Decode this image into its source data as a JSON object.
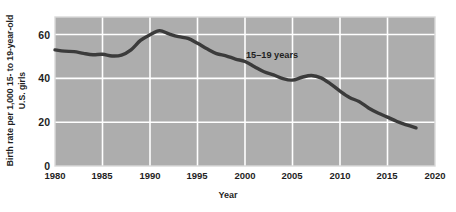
{
  "chart_data": {
    "type": "line",
    "title": "",
    "xlabel": "Year",
    "ylabel_lines": [
      "Birth rate per 1,000 15- to 19-year-old",
      "U.S. girls"
    ],
    "ylabel": "Birth rate per 1,000 15- to 19-year-old U.S. girls",
    "xlim": [
      1980,
      2020
    ],
    "ylim": [
      0,
      68
    ],
    "xticks": [
      "1980",
      "1985",
      "1990",
      "1995",
      "2000",
      "2005",
      "2010",
      "2015",
      "2020"
    ],
    "yticks": [
      "0",
      "20",
      "40",
      "60"
    ],
    "grid": true,
    "legend_position": "inline-annotation",
    "series": [
      {
        "name": "15–19 years",
        "color": "#3b3b3b",
        "x": [
          1980,
          1981,
          1982,
          1983,
          1984,
          1985,
          1986,
          1987,
          1988,
          1989,
          1990,
          1991,
          1992,
          1993,
          1994,
          1995,
          1996,
          1997,
          1998,
          1999,
          2000,
          2001,
          2002,
          2003,
          2004,
          2005,
          2006,
          2007,
          2008,
          2009,
          2010,
          2011,
          2012,
          2013,
          2014,
          2015,
          2016,
          2017,
          2018
        ],
        "values": [
          53.0,
          52.4,
          52.2,
          51.4,
          50.8,
          51.0,
          50.2,
          50.6,
          53.0,
          57.3,
          59.9,
          61.8,
          60.3,
          59.0,
          58.2,
          56.0,
          53.5,
          51.3,
          50.3,
          48.8,
          47.7,
          45.3,
          43.0,
          41.6,
          39.9,
          39.2,
          40.5,
          41.3,
          40.2,
          37.5,
          34.2,
          31.3,
          29.4,
          26.5,
          24.2,
          22.3,
          20.3,
          18.8,
          17.4
        ]
      }
    ]
  },
  "plot": {
    "background_color": "#adadad",
    "grid_color": "#ffffff",
    "frame_color": "#d9d9d9",
    "line_color": "#3b3b3b"
  }
}
